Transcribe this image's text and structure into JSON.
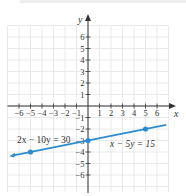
{
  "graph": {
    "x_axis_label": "x",
    "y_axis_label": "y",
    "x_ticks": [
      {
        "value": -6,
        "label": "−6"
      },
      {
        "value": -5,
        "label": "−5"
      },
      {
        "value": -4,
        "label": "−4"
      },
      {
        "value": -3,
        "label": "−3"
      },
      {
        "value": -2,
        "label": "−2"
      },
      {
        "value": -1,
        "label": "−1"
      },
      {
        "value": 1,
        "label": "1"
      },
      {
        "value": 2,
        "label": "2"
      },
      {
        "value": 3,
        "label": "3"
      },
      {
        "value": 4,
        "label": "4"
      },
      {
        "value": 5,
        "label": "5"
      },
      {
        "value": 6,
        "label": "6"
      }
    ],
    "y_ticks": [
      {
        "value": 6,
        "label": "6"
      },
      {
        "value": 5,
        "label": "5"
      },
      {
        "value": 4,
        "label": "4"
      },
      {
        "value": 3,
        "label": "3"
      },
      {
        "value": 2,
        "label": "2"
      },
      {
        "value": 1,
        "label": "1"
      },
      {
        "value": -1,
        "label": "−1"
      },
      {
        "value": -2,
        "label": "−2"
      },
      {
        "value": -3,
        "label": "−3"
      },
      {
        "value": -4,
        "label": "−4"
      },
      {
        "value": -5,
        "label": "−5"
      },
      {
        "value": -6,
        "label": "−6"
      }
    ],
    "equations": {
      "left": "2x − 10y = 30",
      "right": "x − 5y = 15"
    },
    "line": {
      "slope": 0.2,
      "intercept": -3,
      "color": "#2b8ccf"
    },
    "points": [
      {
        "x": -5,
        "y": -4
      },
      {
        "x": 0,
        "y": -3
      },
      {
        "x": 5,
        "y": -2
      }
    ],
    "colors": {
      "grid": "#e4e4e4",
      "axis": "#333333",
      "line": "#2b8ccf"
    }
  }
}
